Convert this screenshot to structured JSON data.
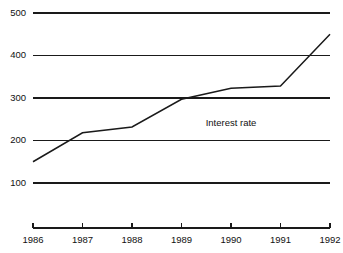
{
  "chart_data": {
    "type": "line",
    "title": "",
    "subtitle": "",
    "xlabel": "",
    "ylabel": "",
    "x": [
      1986,
      1987,
      1988,
      1989,
      1990,
      1991,
      1992
    ],
    "categories": [
      "1986",
      "1987",
      "1988",
      "1989",
      "1990",
      "1991",
      "1992"
    ],
    "series": [
      {
        "name": "Interest rate",
        "values": [
          150,
          218,
          232,
          297,
          323,
          328,
          450
        ]
      }
    ],
    "annotations": [
      {
        "text": "Interest rate",
        "x": 1990.0,
        "y": 240
      }
    ],
    "ylim": [
      0,
      500
    ],
    "xlim": [
      1986,
      1992
    ],
    "yticks": [
      100,
      200,
      300,
      400,
      500
    ],
    "ytick_labels": [
      "100",
      "200",
      "300",
      "400",
      "500"
    ],
    "xticks": [
      1986,
      1987,
      1988,
      1989,
      1990,
      1991,
      1992
    ],
    "xtick_labels": [
      "1986",
      "1987",
      "1988",
      "1989",
      "1990",
      "1991",
      "1992"
    ],
    "grid": true,
    "grid_axis": "y",
    "legend": false,
    "legend_position": "none",
    "line_color": "#1a1a1a",
    "grid_color": "#1a1a1a",
    "axis_color": "#1a1a1a",
    "background_color": "#ffffff"
  }
}
